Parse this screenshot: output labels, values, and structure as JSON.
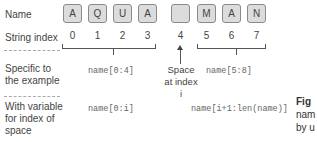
{
  "row_labels": {
    "name": "Name",
    "string_index": "String index",
    "specific": "Specific to the example",
    "variable": "With variable for index of space"
  },
  "characters": [
    "A",
    "Q",
    "U",
    "A",
    "",
    "M",
    "A",
    "N"
  ],
  "indices": [
    "0",
    "1",
    "2",
    "3",
    "4",
    "5",
    "6",
    "7"
  ],
  "annotation": {
    "space": "Space at index i"
  },
  "slices": {
    "specific_left": "name[0:4]",
    "specific_right": "name[5:8]",
    "variable_left": "name[0:i]",
    "variable_right": "name[i+1:len(name)]"
  },
  "caption": {
    "bold": "Fig",
    "line2": "nam",
    "line3": "by u"
  },
  "colors": {
    "box_fill": "#dcdcdc",
    "box_border": "#8a8a8a",
    "text": "#444444",
    "code": "#666666"
  }
}
